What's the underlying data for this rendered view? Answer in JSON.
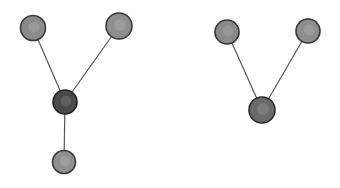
{
  "diagram": {
    "graphs": [
      {
        "name": "y-shaped-tree",
        "nodes": [
          {
            "id": "a",
            "x": 33,
            "y": 28,
            "r": 12.5,
            "fill": "#8a8a8a",
            "stroke": "#3a3a3a"
          },
          {
            "id": "b",
            "x": 119,
            "y": 26,
            "r": 13,
            "fill": "#8e8e8e",
            "stroke": "#3a3a3a"
          },
          {
            "id": "c",
            "x": 65,
            "y": 102,
            "r": 12,
            "fill": "#4a4a4a",
            "stroke": "#222222"
          },
          {
            "id": "d",
            "x": 64,
            "y": 162,
            "r": 11.5,
            "fill": "#8f8f8f",
            "stroke": "#3a3a3a"
          }
        ],
        "edges": [
          [
            "a",
            "c"
          ],
          [
            "b",
            "c"
          ],
          [
            "c",
            "d"
          ]
        ]
      },
      {
        "name": "v-shaped-tree",
        "nodes": [
          {
            "id": "e",
            "x": 227,
            "y": 32,
            "r": 12,
            "fill": "#8a8a8a",
            "stroke": "#333333"
          },
          {
            "id": "f",
            "x": 308,
            "y": 31,
            "r": 12,
            "fill": "#8e8e8e",
            "stroke": "#333333"
          },
          {
            "id": "g",
            "x": 262,
            "y": 110,
            "r": 13,
            "fill": "#6a6a6a",
            "stroke": "#2a2a2a"
          }
        ],
        "edges": [
          [
            "e",
            "g"
          ],
          [
            "f",
            "g"
          ]
        ]
      }
    ],
    "edge_color": "#555555",
    "edge_width": 1.2
  }
}
